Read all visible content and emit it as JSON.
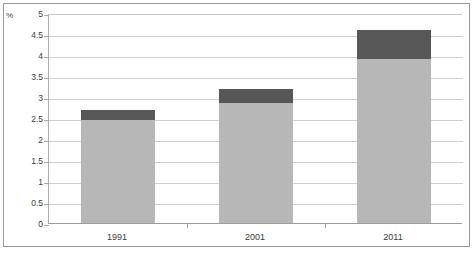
{
  "chart_data": {
    "type": "bar",
    "subtype": "stacked-vertical",
    "title": "",
    "subtitle": "",
    "xlabel": "",
    "ylabel": "%",
    "categories": [
      "1991",
      "2001",
      "2011"
    ],
    "series": [
      {
        "name": "lower-segment",
        "color": "#b7b7b7",
        "values": [
          2.45,
          2.85,
          3.9
        ]
      },
      {
        "name": "upper-segment",
        "color": "#575757",
        "values": [
          0.25,
          0.35,
          0.7
        ]
      }
    ],
    "totals": [
      2.7,
      3.2,
      4.6
    ],
    "ylim": [
      0,
      5
    ],
    "ytick_step": 0.5,
    "ytick_labels": [
      "5",
      "4.5",
      "4",
      "3.5",
      "3",
      "2.5",
      "2",
      "1.5",
      "1",
      "0.5",
      "0"
    ],
    "ytick_values": [
      5,
      4.5,
      4,
      3.5,
      3,
      2.5,
      2,
      1.5,
      1,
      0.5,
      0
    ],
    "grid": true,
    "grid_axis": "y",
    "legend": false,
    "legend_position": "none",
    "annotations": [],
    "colors": {
      "grid": "#d0d0d0",
      "axis": "#9f9f9f",
      "frame": "#9a9a9a",
      "text": "#3b3b3b",
      "background": "#ffffff"
    }
  }
}
